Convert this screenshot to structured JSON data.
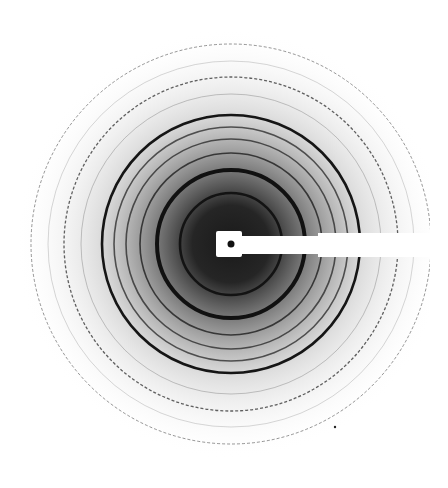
{
  "image": {
    "description": "Powder diffraction ring pattern with beam stop",
    "width": 448,
    "height": 488,
    "background": "#ffffff",
    "center": {
      "x": 231,
      "y": 244
    },
    "halo": {
      "inner_color": "#1a1a1a",
      "mid_color": "#6a6a6a",
      "outer_color": "#ffffff",
      "radius": 215
    },
    "rings": [
      {
        "r": 51,
        "width": 2.6,
        "color": "#0a0a0a",
        "opacity": 0.85
      },
      {
        "r": 74,
        "width": 4.0,
        "color": "#050505",
        "opacity": 0.9
      },
      {
        "r": 91,
        "width": 1.6,
        "color": "#151515",
        "opacity": 0.75
      },
      {
        "r": 105,
        "width": 1.6,
        "color": "#1a1a1a",
        "opacity": 0.7
      },
      {
        "r": 117,
        "width": 1.6,
        "color": "#1a1a1a",
        "opacity": 0.7
      },
      {
        "r": 129,
        "width": 2.6,
        "color": "#000000",
        "opacity": 0.9
      },
      {
        "r": 150,
        "width": 1.0,
        "color": "#606060",
        "opacity": 0.35
      },
      {
        "r": 167,
        "width": 1.3,
        "color": "#202020",
        "opacity": 0.7,
        "dotted": true
      },
      {
        "r": 183,
        "width": 0.9,
        "color": "#707070",
        "opacity": 0.3
      },
      {
        "r": 200,
        "width": 1.0,
        "color": "#404040",
        "opacity": 0.55,
        "dotted": true
      }
    ],
    "beam_stop": {
      "color": "#ffffff",
      "head": {
        "x": 216,
        "y": 231,
        "w": 26,
        "h": 26
      },
      "neck": {
        "x": 238,
        "y": 236,
        "w": 82,
        "h": 18
      },
      "arm": {
        "x": 318,
        "y": 233,
        "w": 130,
        "h": 24
      },
      "center_dot": {
        "x": 231,
        "y": 244,
        "r": 3.5,
        "color": "#111111"
      }
    },
    "right_white_margin_x": 430,
    "bottom_white_margin_y": 476,
    "speck": {
      "x": 335,
      "y": 427,
      "r": 1.2
    }
  }
}
